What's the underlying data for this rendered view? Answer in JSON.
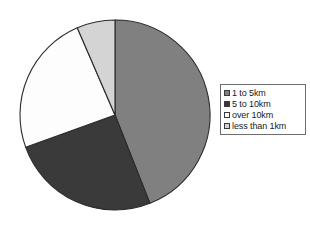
{
  "chart_data": {
    "type": "pie",
    "title": "",
    "subtitle": "",
    "xlabel": "",
    "ylabel": "",
    "legend_position": "right",
    "grid": false,
    "start_angle_deg": 0,
    "direction": "clockwise",
    "categories": [
      "1 to 5km",
      "5 to 10km",
      "over 10km",
      "less than 1km"
    ],
    "values": [
      44,
      25.5,
      24,
      6.5
    ],
    "units": "percent",
    "colors": [
      "#808080",
      "#3a3a3a",
      "#fdfdfd",
      "#d4d4d4"
    ],
    "slices": [
      {
        "label": "1 to 5km",
        "value": 44,
        "color": "#808080",
        "start_angle_deg": 0,
        "end_angle_deg": 158.4
      },
      {
        "label": "5 to 10km",
        "value": 25.5,
        "color": "#3a3a3a",
        "start_angle_deg": 158.4,
        "end_angle_deg": 250.2
      },
      {
        "label": "over 10km",
        "value": 24,
        "color": "#fdfdfd",
        "start_angle_deg": 250.2,
        "end_angle_deg": 336.6
      },
      {
        "label": "less than 1km",
        "value": 6.5,
        "color": "#d4d4d4",
        "start_angle_deg": 336.6,
        "end_angle_deg": 360
      }
    ]
  },
  "legend": {
    "items": [
      {
        "label": "1 to 5km",
        "color": "#808080",
        "swatch_icon": "square-swatch-icon"
      },
      {
        "label": "5 to 10km",
        "color": "#3a3a3a",
        "swatch_icon": "square-swatch-icon"
      },
      {
        "label": "over 10km",
        "color": "#fdfdfd",
        "swatch_icon": "square-swatch-icon"
      },
      {
        "label": "less than 1km",
        "color": "#d4d4d4",
        "swatch_icon": "square-swatch-icon"
      }
    ],
    "border_color": "#6d6d6d",
    "background": "#ffffff"
  },
  "style": {
    "page_background": "#ffffff",
    "slice_outline": "#2b2b2b"
  },
  "geometry": {
    "center_x": 96,
    "center_y": 96,
    "radius": 95
  }
}
